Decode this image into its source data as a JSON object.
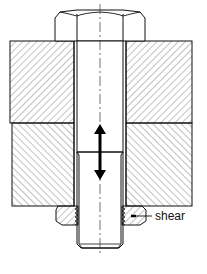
{
  "diagram": {
    "type": "mechanical cross-section",
    "components": [
      {
        "id": "bolt-head",
        "label": "hex bolt head"
      },
      {
        "id": "upper-plate",
        "label": "upper clamped plate (hatched)"
      },
      {
        "id": "lower-plate",
        "label": "lower clamped plate (hatched)"
      },
      {
        "id": "bolt-shank",
        "label": "bolt shank with thread"
      },
      {
        "id": "nut",
        "label": "nut (hatched, threaded)"
      },
      {
        "id": "axial-arrow",
        "label": "double-headed axial load arrow"
      }
    ],
    "annotations": {
      "shear_label": "shear"
    },
    "colors": {
      "line": "#111111",
      "hatch": "#555555",
      "background": "#ffffff"
    }
  }
}
